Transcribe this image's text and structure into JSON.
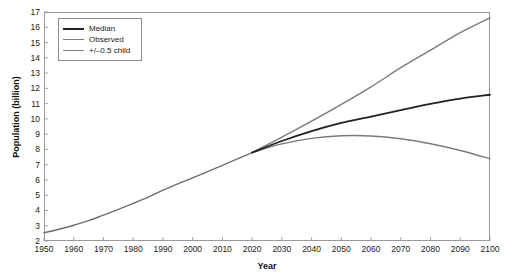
{
  "chart_data": {
    "type": "line",
    "title": "",
    "xlabel": "Year",
    "ylabel": "Population (billion)",
    "xlim": [
      1950,
      2100
    ],
    "ylim": [
      2,
      17
    ],
    "grid": false,
    "legend_position": "top-left",
    "xticks": [
      1950,
      1960,
      1970,
      1980,
      1990,
      2000,
      2010,
      2020,
      2030,
      2040,
      2050,
      2060,
      2070,
      2080,
      2090,
      2100
    ],
    "yticks": [
      2,
      3,
      4,
      5,
      6,
      7,
      8,
      9,
      10,
      11,
      12,
      13,
      14,
      15,
      16,
      17
    ],
    "series": [
      {
        "name": "Observed",
        "color": "#6f6f6f",
        "width": 1.4,
        "x": [
          1950,
          1955,
          1960,
          1965,
          1970,
          1975,
          1980,
          1985,
          1990,
          1995,
          2000,
          2005,
          2010,
          2015,
          2020
        ],
        "values": [
          2.54,
          2.77,
          3.03,
          3.33,
          3.7,
          4.07,
          4.46,
          4.87,
          5.33,
          5.74,
          6.14,
          6.54,
          6.96,
          7.38,
          7.79
        ]
      },
      {
        "name": "Median",
        "color": "#222222",
        "width": 1.8,
        "x": [
          2020,
          2030,
          2040,
          2050,
          2060,
          2070,
          2080,
          2090,
          2100
        ],
        "values": [
          7.79,
          8.55,
          9.2,
          9.74,
          10.15,
          10.58,
          10.98,
          11.32,
          11.58
        ]
      },
      {
        "name": "+/-0.5 child (high)",
        "color": "#7a7a7a",
        "width": 1.4,
        "x": [
          2020,
          2030,
          2040,
          2050,
          2060,
          2070,
          2080,
          2090,
          2100
        ],
        "values": [
          7.79,
          8.8,
          9.85,
          10.95,
          12.1,
          13.35,
          14.5,
          15.65,
          16.62
        ]
      },
      {
        "name": "+/-0.5 child (low)",
        "color": "#7a7a7a",
        "width": 1.4,
        "x": [
          2020,
          2030,
          2040,
          2050,
          2060,
          2070,
          2080,
          2090,
          2100
        ],
        "values": [
          7.79,
          8.36,
          8.72,
          8.89,
          8.88,
          8.7,
          8.37,
          7.93,
          7.38
        ]
      }
    ]
  },
  "legend": {
    "items": [
      {
        "label": "Median",
        "color": "#222222",
        "width": "2px"
      },
      {
        "label": "Observed",
        "color": "#7a7a7a",
        "width": "1.5px"
      },
      {
        "label": "+/–0.5 child",
        "color": "#8a8a8a",
        "width": "1.5px"
      }
    ]
  },
  "axes": {
    "x_title": "Year",
    "y_title": "Population (billion)"
  },
  "colors": {
    "frame": "#9a9a9a",
    "median": "#222222",
    "observed": "#6f6f6f",
    "band": "#7a7a7a",
    "text": "#1a1a1a",
    "background": "#ffffff"
  }
}
